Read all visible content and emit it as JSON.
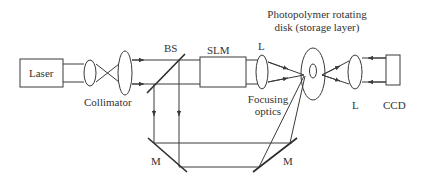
{
  "diagram": {
    "type": "holographic-storage-optical-setup",
    "components": {
      "laser": "Laser",
      "collimator": "Collimator",
      "beam_splitter": "BS",
      "slm": "SLM",
      "lens_focus": "L",
      "focusing_optics_line1": "Focusing",
      "focusing_optics_line2": "optics",
      "disk_line1": "Photopolymer rotating",
      "disk_line2": "disk (storage layer)",
      "lens_readout": "L",
      "ccd": "CCD",
      "mirror_left": "M",
      "mirror_right": "M"
    },
    "colors": {
      "line": "#3a3a3a",
      "text": "#333333",
      "background": "#ffffff"
    }
  }
}
